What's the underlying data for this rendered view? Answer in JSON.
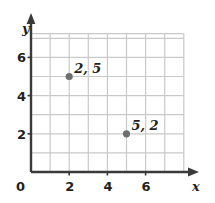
{
  "chart_data": {
    "type": "scatter",
    "title": "",
    "xlabel": "x",
    "ylabel": "y",
    "xlim": [
      0,
      8
    ],
    "ylim": [
      0,
      7
    ],
    "grid": true,
    "legend": null,
    "x_ticks": [
      "0",
      "2",
      "4",
      "6"
    ],
    "x_tick_values": [
      0,
      2,
      4,
      6
    ],
    "y_ticks": [
      "2",
      "4",
      "6"
    ],
    "y_tick_values": [
      2,
      4,
      6
    ],
    "origin_label": "0",
    "points": [
      {
        "x": 2,
        "y": 5,
        "label": "2, 5"
      },
      {
        "x": 5,
        "y": 2,
        "label": "5, 2"
      }
    ],
    "colors": {
      "grid": "#c9c9c9",
      "axis": "#3a3a3a",
      "point": "#6e6e6e",
      "text": "#231f20",
      "background": "#ffffff"
    }
  }
}
